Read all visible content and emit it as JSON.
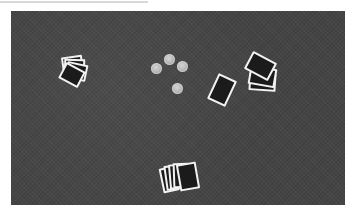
{
  "scene": {
    "description": "Overhead grayscale view of a dark felt card table with four hands of face-down playing cards and four poker chips in the center",
    "table_color": "#444444",
    "card_back_color": "#1b1b1b",
    "card_border_color": "#f2f2f2",
    "chip_color": "#b4b4b4"
  },
  "hands": [
    {
      "position": "left",
      "card_count": 4
    },
    {
      "position": "center-right",
      "card_count": 1
    },
    {
      "position": "right",
      "card_count": 3
    },
    {
      "position": "bottom",
      "card_count": 5
    }
  ],
  "chips": {
    "count": 4
  }
}
